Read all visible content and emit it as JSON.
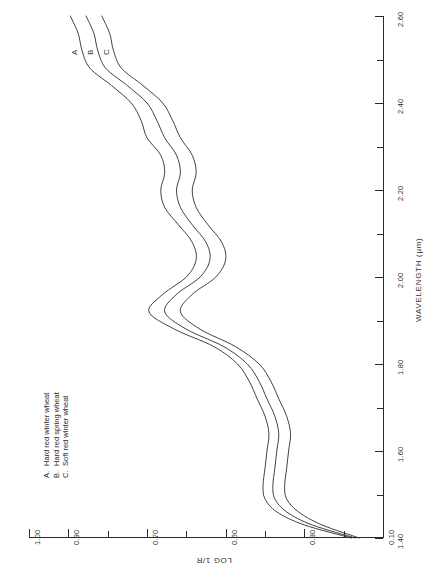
{
  "chart_data": {
    "type": "line",
    "title": "",
    "orientation": "rotated-90-ccw",
    "xlabel": "WAVELENGTH  (μm)",
    "ylabel": "LOG 1/R",
    "xlim": [
      1.4,
      2.6
    ],
    "ylim": [
      0.1,
      1.0
    ],
    "xticks": [
      1.4,
      1.6,
      1.8,
      2.0,
      2.2,
      2.4,
      2.6
    ],
    "xtick_labels": [
      "1.40",
      "1.60",
      "1.80",
      "2.00",
      "2.20",
      "2.40",
      "2.60"
    ],
    "xminor_ticks": [
      1.5,
      1.7,
      1.9,
      2.1,
      2.3,
      2.5
    ],
    "yticks": [
      1.0,
      0.9,
      0.7,
      0.5,
      0.3,
      0.1
    ],
    "ytick_labels": [
      "1.00",
      "0.90",
      "0.70",
      "0.50",
      "0.30",
      "0.10"
    ],
    "yminor_ticks": [
      0.8,
      0.6,
      0.4,
      0.2
    ],
    "grid": false,
    "legend_position": "upper-left",
    "series": [
      {
        "name": "A",
        "label": "Hard red winter wheat",
        "x": [
          1.4,
          1.43,
          1.46,
          1.49,
          1.52,
          1.56,
          1.6,
          1.64,
          1.68,
          1.72,
          1.76,
          1.8,
          1.84,
          1.88,
          1.92,
          1.96,
          2.0,
          2.04,
          2.08,
          2.12,
          2.16,
          2.2,
          2.24,
          2.28,
          2.32,
          2.36,
          2.4,
          2.44,
          2.48,
          2.52,
          2.56,
          2.6
        ],
        "y": [
          0.18,
          0.3,
          0.37,
          0.4,
          0.405,
          0.4,
          0.395,
          0.39,
          0.4,
          0.42,
          0.44,
          0.47,
          0.53,
          0.63,
          0.695,
          0.66,
          0.6,
          0.575,
          0.585,
          0.62,
          0.655,
          0.665,
          0.655,
          0.665,
          0.7,
          0.715,
          0.74,
          0.79,
          0.845,
          0.865,
          0.875,
          0.895
        ]
      },
      {
        "name": "B",
        "label": "Hard red spring wheat",
        "x": [
          1.4,
          1.43,
          1.46,
          1.49,
          1.52,
          1.56,
          1.6,
          1.64,
          1.68,
          1.72,
          1.76,
          1.8,
          1.84,
          1.88,
          1.92,
          1.96,
          2.0,
          2.04,
          2.08,
          2.12,
          2.16,
          2.2,
          2.24,
          2.28,
          2.32,
          2.36,
          2.4,
          2.44,
          2.48,
          2.52,
          2.56,
          2.6
        ],
        "y": [
          0.17,
          0.28,
          0.345,
          0.375,
          0.38,
          0.375,
          0.37,
          0.365,
          0.375,
          0.395,
          0.415,
          0.445,
          0.505,
          0.6,
          0.655,
          0.625,
          0.565,
          0.54,
          0.55,
          0.585,
          0.615,
          0.625,
          0.615,
          0.625,
          0.655,
          0.675,
          0.7,
          0.75,
          0.805,
          0.825,
          0.835,
          0.855
        ]
      },
      {
        "name": "C",
        "label": "Soft red winter wheat",
        "x": [
          1.4,
          1.43,
          1.46,
          1.49,
          1.52,
          1.56,
          1.6,
          1.64,
          1.68,
          1.72,
          1.76,
          1.8,
          1.84,
          1.88,
          1.92,
          1.96,
          2.0,
          2.04,
          2.08,
          2.12,
          2.16,
          2.2,
          2.24,
          2.28,
          2.32,
          2.36,
          2.4,
          2.44,
          2.48,
          2.52,
          2.56,
          2.6
        ],
        "y": [
          0.16,
          0.255,
          0.315,
          0.345,
          0.35,
          0.345,
          0.34,
          0.335,
          0.345,
          0.365,
          0.385,
          0.415,
          0.475,
          0.565,
          0.615,
          0.585,
          0.525,
          0.5,
          0.51,
          0.545,
          0.575,
          0.585,
          0.575,
          0.585,
          0.615,
          0.635,
          0.66,
          0.71,
          0.765,
          0.785,
          0.795,
          0.815
        ]
      }
    ]
  },
  "axes": {
    "y_title": "LOG 1/R",
    "x_title": "WAVELENGTH  (μm)"
  },
  "legend": {
    "entries": [
      {
        "key": "A.",
        "text": "Hard red winter wheat"
      },
      {
        "key": "B.",
        "text": "Hard red spring wheat"
      },
      {
        "key": "C.",
        "text": "Soft red winter wheat"
      }
    ]
  },
  "curve_labels": {
    "a": "A",
    "b": "B",
    "c": "C"
  }
}
